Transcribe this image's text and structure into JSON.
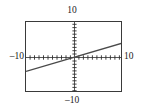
{
  "figure": {
    "name": "graphing-calculator-plot",
    "background_color": "#ffffff",
    "frame_color": "#3a3a3a"
  },
  "labels": {
    "ymax": "10",
    "ymin": "–10",
    "xmin": "–10",
    "xmax": "10"
  },
  "chart_data": {
    "type": "line",
    "title": "",
    "xlabel": "",
    "ylabel": "",
    "xlim": [
      -10,
      10
    ],
    "ylim": [
      -10,
      10
    ],
    "grid": false,
    "legend": null,
    "axes": {
      "x_axis_y": 0,
      "y_axis_x": 0,
      "tick_style": "tick-marks",
      "x_tick_interval": 1,
      "y_tick_interval": 1,
      "x_ticks": [
        -10,
        -9,
        -8,
        -7,
        -6,
        -5,
        -4,
        -3,
        -2,
        -1,
        0,
        1,
        2,
        3,
        4,
        5,
        6,
        7,
        8,
        9,
        10
      ],
      "y_ticks": [
        -10,
        -9,
        -8,
        -7,
        -6,
        -5,
        -4,
        -3,
        -2,
        -1,
        0,
        1,
        2,
        3,
        4,
        5,
        6,
        7,
        8,
        9,
        10
      ]
    },
    "series": [
      {
        "name": "line",
        "color": "#4a4a4a",
        "equation": "y = 0.4x + 0.1",
        "slope": 0.4,
        "intercept": 0.1,
        "x": [
          -10,
          10
        ],
        "values": [
          -3.9,
          4.1
        ]
      }
    ]
  }
}
